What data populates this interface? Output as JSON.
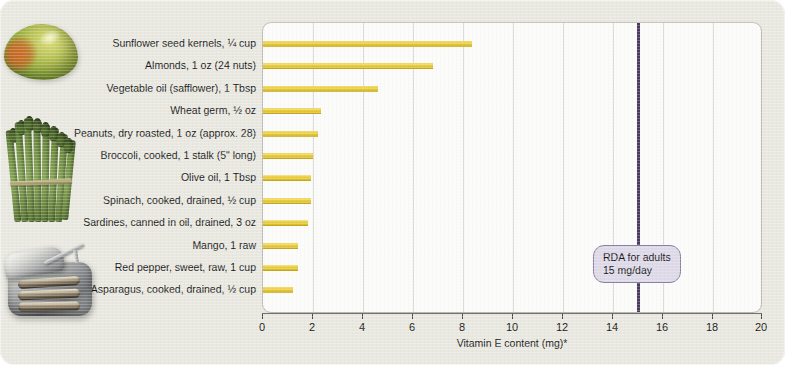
{
  "chart_data": {
    "type": "bar",
    "orientation": "horizontal",
    "title": "",
    "xlabel": "Vitamin E content (mg)*",
    "ylabel": "",
    "xlim": [
      0,
      20
    ],
    "xticks": [
      0,
      2,
      4,
      6,
      8,
      10,
      12,
      14,
      16,
      18,
      20
    ],
    "grid": true,
    "legend": "none",
    "categories": [
      "Sunflower seed kernels, ¼ cup",
      "Almonds, 1 oz (24 nuts)",
      "Vegetable oil (safflower), 1 Tbsp",
      "Wheat germ, ½ oz",
      "Peanuts, dry roasted, 1 oz (approx. 28)",
      "Broccoli, cooked, 1 stalk (5\" long)",
      "Olive oil, 1 Tbsp",
      "Spinach, cooked, drained, ½ cup",
      "Sardines, canned in oil, drained, 3 oz",
      "Mango, 1 raw",
      "Red pepper, sweet, raw, 1 cup",
      "Asparagus, cooked, drained, ½ cup"
    ],
    "values": [
      8.35,
      6.8,
      4.6,
      2.3,
      2.2,
      2.0,
      1.9,
      1.9,
      1.8,
      1.4,
      1.4,
      1.2
    ],
    "bar_color": "#ead043",
    "annotations": [
      {
        "name": "rda-marker",
        "value": 15,
        "line_color": "#4b3b5c",
        "label_line1": "RDA for adults",
        "label_line2": "15 mg/day",
        "box_fill": "#ddd9e8",
        "box_border": "#8a82a0"
      }
    ]
  },
  "figure": {
    "background_color": "#e9e8e0",
    "plot_background_color": "#fbfbfa",
    "plot_border_color": "#b9b8b2",
    "gridline_color": "#d9d9d4",
    "axis_color": "#4a4a48"
  },
  "photos": [
    {
      "name": "mango-photo",
      "alt": "Ripe mango"
    },
    {
      "name": "asparagus-photo",
      "alt": "Bundle of asparagus spears"
    },
    {
      "name": "sardine-tin-photo",
      "alt": "Open tin of sardines in oil"
    }
  ]
}
